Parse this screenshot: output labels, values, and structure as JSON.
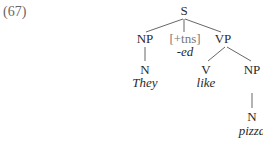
{
  "example": {
    "number": "(67)"
  },
  "tree": {
    "root": "S",
    "subject_np": {
      "label": "NP",
      "n": "N",
      "word": "They"
    },
    "tense": {
      "label": "[+tns]",
      "affix": "-ed"
    },
    "vp": {
      "label": "VP",
      "v": {
        "label": "V",
        "word": "like"
      },
      "object_np": {
        "label": "NP",
        "n": "N",
        "word": "pizza"
      }
    }
  },
  "colors": {
    "text": "#2a2a2a",
    "feature": "#777777",
    "lines": "#555555"
  }
}
